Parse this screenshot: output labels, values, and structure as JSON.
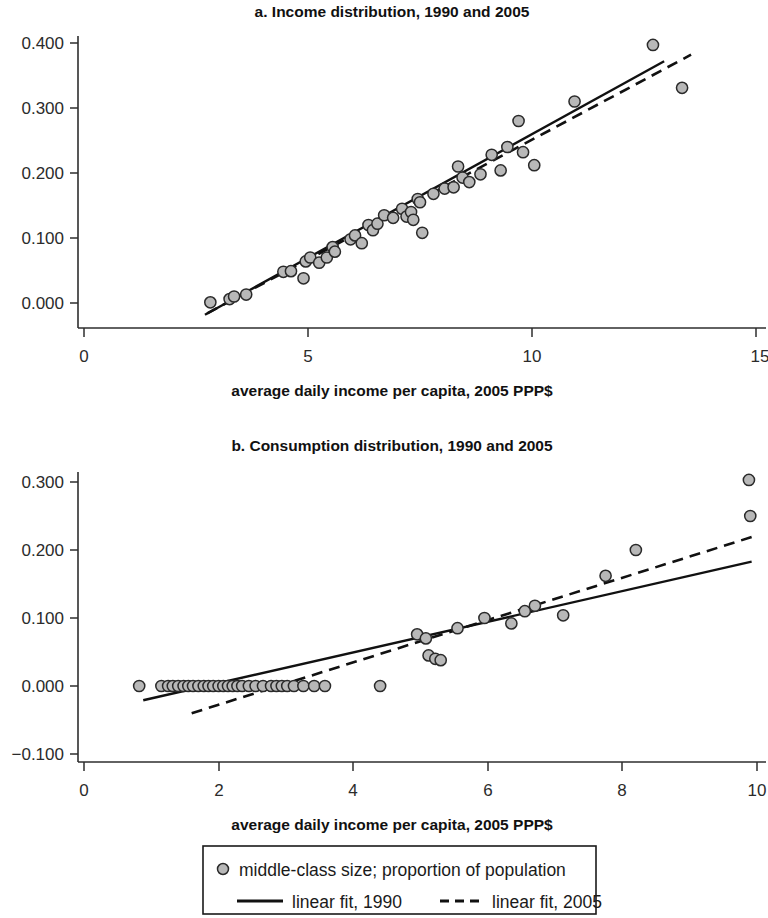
{
  "figure": {
    "background": "#ffffff",
    "marker_fill": "#b8b8b8",
    "marker_stroke": "#2a2a2a",
    "line_color": "#111111"
  },
  "legend": {
    "points_label": "middle-class size; proportion of population",
    "fit1990_label": "linear fit, 1990",
    "fit2005_label": "linear fit, 2005"
  },
  "chart_data": [
    {
      "type": "scatter",
      "panel": "a",
      "title": "a. Income distribution, 1990 and 2005",
      "xlabel": "average daily income per capita, 2005 PPP$",
      "ylabel": "",
      "xlim": [
        0,
        15
      ],
      "ylim": [
        -0.04,
        0.42
      ],
      "grid": false,
      "xticks": [
        0,
        5,
        10,
        15
      ],
      "xtick_labels": [
        "0",
        "5",
        "10",
        "15"
      ],
      "yticks": [
        0.0,
        0.1,
        0.2,
        0.3,
        0.4
      ],
      "ytick_labels": [
        "0.000",
        "0.100",
        "0.200",
        "0.300",
        "0.400"
      ],
      "legend_position": "below figure",
      "series": [
        {
          "name": "middle-class size; proportion of population",
          "type": "scatter",
          "points": [
            [
              2.82,
              0.001
            ],
            [
              3.25,
              0.006
            ],
            [
              3.35,
              0.01
            ],
            [
              3.62,
              0.013
            ],
            [
              4.45,
              0.048
            ],
            [
              4.62,
              0.049
            ],
            [
              4.9,
              0.038
            ],
            [
              4.95,
              0.064
            ],
            [
              5.05,
              0.07
            ],
            [
              5.25,
              0.062
            ],
            [
              5.42,
              0.07
            ],
            [
              5.55,
              0.086
            ],
            [
              5.6,
              0.079
            ],
            [
              5.95,
              0.098
            ],
            [
              6.05,
              0.104
            ],
            [
              6.2,
              0.092
            ],
            [
              6.35,
              0.12
            ],
            [
              6.45,
              0.112
            ],
            [
              6.55,
              0.122
            ],
            [
              6.7,
              0.135
            ],
            [
              6.9,
              0.131
            ],
            [
              7.1,
              0.145
            ],
            [
              7.2,
              0.133
            ],
            [
              7.3,
              0.14
            ],
            [
              7.35,
              0.128
            ],
            [
              7.45,
              0.16
            ],
            [
              7.5,
              0.155
            ],
            [
              7.55,
              0.108
            ],
            [
              7.8,
              0.168
            ],
            [
              8.05,
              0.176
            ],
            [
              8.25,
              0.178
            ],
            [
              8.35,
              0.21
            ],
            [
              8.45,
              0.193
            ],
            [
              8.6,
              0.186
            ],
            [
              8.85,
              0.198
            ],
            [
              9.1,
              0.228
            ],
            [
              9.3,
              0.204
            ],
            [
              9.45,
              0.24
            ],
            [
              9.7,
              0.28
            ],
            [
              9.8,
              0.232
            ],
            [
              10.05,
              0.212
            ],
            [
              10.95,
              0.31
            ],
            [
              12.7,
              0.397
            ],
            [
              13.35,
              0.331
            ]
          ]
        },
        {
          "name": "linear fit, 1990",
          "type": "line",
          "style": "solid",
          "points": [
            [
              2.7,
              -0.018
            ],
            [
              12.95,
              0.372
            ]
          ]
        },
        {
          "name": "linear fit, 2005",
          "type": "line",
          "style": "dashed",
          "points": [
            [
              2.75,
              -0.016
            ],
            [
              13.55,
              0.382
            ]
          ]
        }
      ]
    },
    {
      "type": "scatter",
      "panel": "b",
      "title": "b. Consumption distribution, 1990 and 2005",
      "xlabel": "average daily income per capita, 2005 PPP$",
      "ylabel": "",
      "xlim": [
        0,
        10
      ],
      "ylim": [
        -0.12,
        0.32
      ],
      "grid": false,
      "xticks": [
        0,
        2,
        4,
        6,
        8,
        10
      ],
      "xtick_labels": [
        "0",
        "2",
        "4",
        "6",
        "8",
        "10"
      ],
      "yticks": [
        -0.1,
        0.0,
        0.1,
        0.2,
        0.3
      ],
      "ytick_labels": [
        "−0.100",
        "0.000",
        "0.100",
        "0.200",
        "0.300"
      ],
      "legend_position": "below figure",
      "series": [
        {
          "name": "middle-class size; proportion of population",
          "type": "scatter",
          "points": [
            [
              0.82,
              0.0
            ],
            [
              1.15,
              0.0
            ],
            [
              1.25,
              0.0
            ],
            [
              1.32,
              0.0
            ],
            [
              1.4,
              0.0
            ],
            [
              1.48,
              0.0
            ],
            [
              1.55,
              0.0
            ],
            [
              1.62,
              0.0
            ],
            [
              1.7,
              0.0
            ],
            [
              1.78,
              0.0
            ],
            [
              1.85,
              0.0
            ],
            [
              1.92,
              0.0
            ],
            [
              2.0,
              0.0
            ],
            [
              2.07,
              0.0
            ],
            [
              2.14,
              0.0
            ],
            [
              2.21,
              0.0
            ],
            [
              2.28,
              0.0
            ],
            [
              2.35,
              0.0
            ],
            [
              2.45,
              0.0
            ],
            [
              2.55,
              0.0
            ],
            [
              2.66,
              0.0
            ],
            [
              2.78,
              0.0
            ],
            [
              2.86,
              0.0
            ],
            [
              2.94,
              0.0
            ],
            [
              3.02,
              0.0
            ],
            [
              3.12,
              0.0
            ],
            [
              3.26,
              0.0
            ],
            [
              3.42,
              0.0
            ],
            [
              3.58,
              0.0
            ],
            [
              4.4,
              0.0
            ],
            [
              4.95,
              0.076
            ],
            [
              5.08,
              0.07
            ],
            [
              5.12,
              0.045
            ],
            [
              5.22,
              0.04
            ],
            [
              5.3,
              0.038
            ],
            [
              5.55,
              0.085
            ],
            [
              5.95,
              0.1
            ],
            [
              6.35,
              0.092
            ],
            [
              6.55,
              0.11
            ],
            [
              6.7,
              0.118
            ],
            [
              7.12,
              0.104
            ],
            [
              7.75,
              0.162
            ],
            [
              8.2,
              0.2
            ],
            [
              9.88,
              0.303
            ],
            [
              9.9,
              0.25
            ]
          ]
        },
        {
          "name": "linear fit, 1990",
          "type": "line",
          "style": "solid",
          "points": [
            [
              0.88,
              -0.021
            ],
            [
              9.92,
              0.183
            ]
          ]
        },
        {
          "name": "linear fit, 2005",
          "type": "line",
          "style": "dashed",
          "points": [
            [
              1.6,
              -0.04
            ],
            [
              9.92,
              0.219
            ]
          ]
        }
      ]
    }
  ]
}
